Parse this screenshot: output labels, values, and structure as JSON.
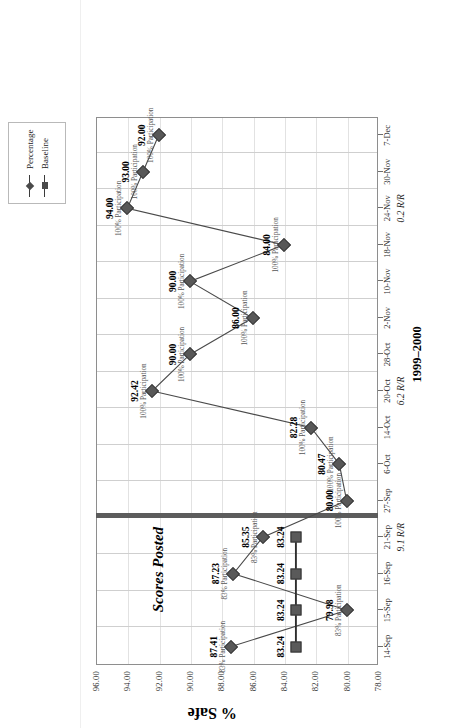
{
  "legend": {
    "items": [
      {
        "label": "Percentage",
        "marker": "diamond-marker"
      },
      {
        "label": "Baseline",
        "marker": "square-marker"
      }
    ]
  },
  "axes": {
    "y_title": "% Safe",
    "y_ticks": [
      "96.00",
      "94.00",
      "92.00",
      "90.00",
      "88.00",
      "86.00",
      "84.00",
      "82.00",
      "80.00",
      "78.00"
    ],
    "x_ticks": [
      "14-Sep",
      "15-Sep",
      "16-Sep",
      "21-Sep",
      "27-Sep",
      "6-Oct",
      "14-Oct",
      "20-Oct",
      "28-Oct",
      "2-Nov",
      "10-Nov",
      "18-Nov",
      "24-Nov",
      "30-Nov",
      "7-Dec"
    ]
  },
  "annotations": {
    "divider_label": "Scores Posted",
    "period": "1999–2000",
    "rir": [
      {
        "label": "9.1 R/R",
        "at": "21-Sep"
      },
      {
        "label": "6.2 R/R",
        "at": "20-Oct"
      },
      {
        "label": "0.2 R/R",
        "at": "24-Nov"
      }
    ]
  },
  "chart_data": {
    "type": "line",
    "title": "1999–2000",
    "xlabel": "",
    "ylabel": "% Safe",
    "ylim": [
      78.0,
      96.0
    ],
    "grid": true,
    "legend_position": "top-right",
    "categories": [
      "14-Sep",
      "15-Sep",
      "16-Sep",
      "21-Sep",
      "27-Sep",
      "6-Oct",
      "14-Oct",
      "20-Oct",
      "28-Oct",
      "2-Nov",
      "10-Nov",
      "18-Nov",
      "24-Nov",
      "30-Nov",
      "7-Dec"
    ],
    "series": [
      {
        "name": "Percentage",
        "values": [
          87.41,
          79.98,
          87.23,
          85.35,
          80.0,
          80.47,
          82.28,
          92.42,
          90.0,
          86.0,
          90.0,
          84.0,
          94.0,
          93.0,
          92.0
        ],
        "point_labels": [
          "87.41",
          "79.98",
          "87.23",
          "85.35",
          "80.00",
          "80.47",
          "82.28",
          "92.42",
          "90.00",
          "86.00",
          "90.00",
          "84.00",
          "94.00",
          "93.00",
          "92.00"
        ],
        "point_sublabels": [
          "83% Participation",
          "83% Participation",
          "83% Participation",
          "83% Participation",
          "100% Participation",
          "100% Participation",
          "100% Participation",
          "100% Participation",
          "100% Participation",
          "100% Participation",
          "100% Participation",
          "100% Participation",
          "100% Participation",
          "100% Participation",
          "100% Participation"
        ]
      },
      {
        "name": "Baseline",
        "values": [
          83.24,
          83.24,
          83.24,
          83.24,
          null,
          null,
          null,
          null,
          null,
          null,
          null,
          null,
          null,
          null,
          null
        ],
        "point_labels": [
          "83.24",
          "83.24",
          "83.24",
          "83.24",
          "",
          "",
          "",
          "",
          "",
          "",
          "",
          "",
          "",
          "",
          ""
        ]
      }
    ]
  }
}
